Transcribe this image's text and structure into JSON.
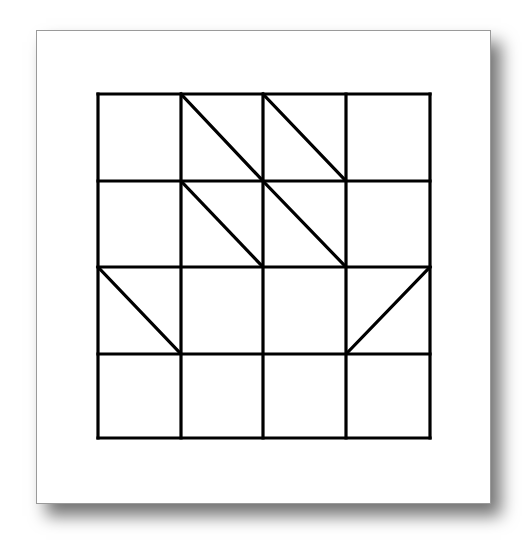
{
  "figure": {
    "rows": 4,
    "cols": 4,
    "line_color": "#000000",
    "card_background": "#ffffff",
    "card_border": "#9a9a9a",
    "grid_bounds": {
      "x0": 98,
      "y0": 94,
      "x1": 430,
      "y1": 438
    },
    "col_lines": [
      98,
      181,
      263,
      346,
      430
    ],
    "row_lines": [
      94,
      181,
      267,
      354,
      438
    ],
    "diagonals": [
      {
        "row": 0,
        "col": 1,
        "direction": "tl-br"
      },
      {
        "row": 0,
        "col": 2,
        "direction": "tl-br"
      },
      {
        "row": 1,
        "col": 1,
        "direction": "tl-br"
      },
      {
        "row": 1,
        "col": 2,
        "direction": "tl-br"
      },
      {
        "row": 2,
        "col": 0,
        "direction": "tl-br"
      },
      {
        "row": 2,
        "col": 3,
        "direction": "bl-tr"
      }
    ]
  }
}
